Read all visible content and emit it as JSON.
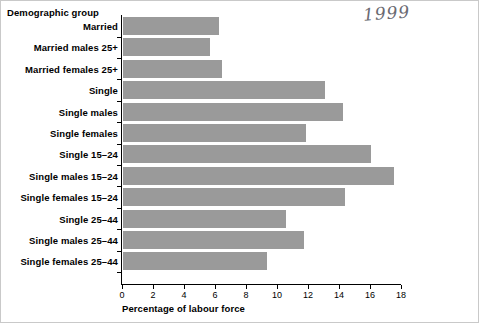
{
  "annotation": {
    "handwritten_year": "1999"
  },
  "titles": {
    "group_axis": "Demographic group",
    "x_axis": "Percentage of labour force"
  },
  "chart_data": {
    "type": "bar",
    "orientation": "horizontal",
    "title": "",
    "subtitle": "",
    "xlabel": "Percentage of labour force",
    "ylabel": "Demographic group",
    "xlim": [
      0,
      18
    ],
    "xticks": [
      0,
      2,
      4,
      6,
      8,
      10,
      12,
      14,
      16,
      18
    ],
    "xtick_labels": [
      "0",
      "2",
      "4",
      "6",
      "8",
      "10",
      "12",
      "14",
      "16",
      "18"
    ],
    "grid": false,
    "legend": null,
    "bar_color": "#9a9a9a",
    "segment_divider_color": "#ffffff",
    "segment_interval": 2,
    "categories": [
      "Married",
      "Married males 25+",
      "Married females 25+",
      "Single",
      "Single males",
      "Single females",
      "Single 15–24",
      "Single males 15–24",
      "Single females 15–24",
      "Single 25–44",
      "Single males 25–44",
      "Single females 25–44"
    ],
    "values": [
      6.2,
      5.6,
      6.4,
      13.0,
      14.2,
      11.8,
      16.0,
      17.5,
      14.3,
      10.5,
      11.7,
      9.3
    ]
  },
  "colors": {
    "bar": "#9a9a9a",
    "axis": "#000000",
    "background": "#ffffff",
    "border": "#c9c9c9",
    "annotation": "#6a6a72"
  }
}
